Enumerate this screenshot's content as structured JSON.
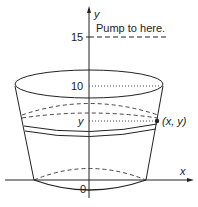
{
  "diagram": {
    "type": "tank-pumping-diagram",
    "annotation": "Pump to here.",
    "axes": {
      "x_label": "x",
      "y_label": "y",
      "origin_label": "0"
    },
    "ticks": {
      "y_15": "15",
      "y_10": "10",
      "y_var": "y"
    },
    "point_label": "(x, y)",
    "colors": {
      "stroke": "#222222",
      "background": "#ffffff"
    }
  }
}
